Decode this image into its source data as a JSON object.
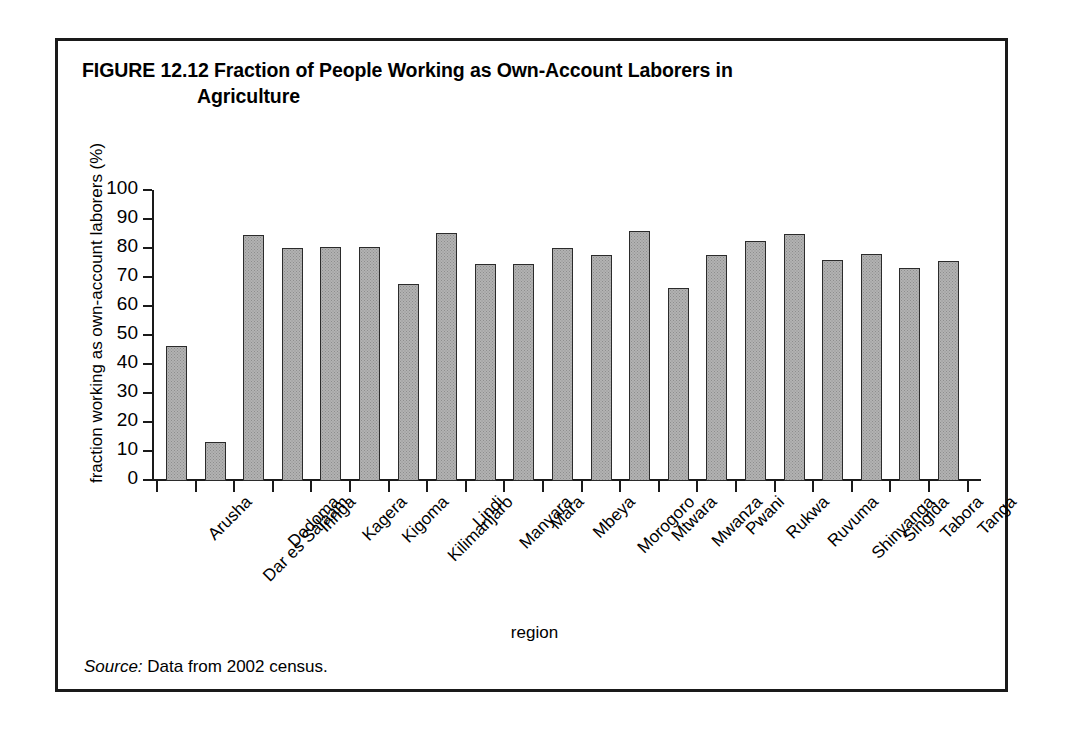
{
  "figure": {
    "label": "FIGURE 12.12",
    "title_line1": "Fraction of People Working as Own-Account Laborers in",
    "title_line2": "Agriculture",
    "source_word": "Source:",
    "source_text": " Data from 2002 census."
  },
  "chart_data": {
    "type": "bar",
    "title": "Fraction of People Working as Own-Account Laborers in Agriculture",
    "xlabel": "region",
    "ylabel": "fraction working as own-account laborers (%)",
    "ylim": [
      0,
      100
    ],
    "yticks": [
      0,
      10,
      20,
      30,
      40,
      50,
      60,
      70,
      80,
      90,
      100
    ],
    "ytick_labels": [
      "0",
      "10",
      "20",
      "30",
      "40",
      "50",
      "60",
      "70",
      "80",
      "90",
      "100"
    ],
    "grid": false,
    "legend": null,
    "bar_fill_color": "#b2b2b2",
    "bar_edge_color": "#2b2b2b",
    "categories": [
      "Arusha",
      "Dar es Salaam",
      "Dodoma",
      "Iringa",
      "Kagera",
      "Kigoma",
      "Kilimanjaro",
      "Lindi",
      "Manyara",
      "Mara",
      "Mbeya",
      "Morogoro",
      "Mtwara",
      "Mwanza",
      "Pwani",
      "Rukwa",
      "Ruvuma",
      "Shinyanga",
      "Singida",
      "Tabora",
      "Tanga"
    ],
    "values": [
      46.4,
      13.4,
      84.8,
      80.2,
      80.6,
      80.8,
      68.0,
      85.5,
      74.8,
      75.0,
      80.4,
      78.0,
      86.2,
      66.7,
      78.0,
      82.6,
      85.3,
      76.1,
      78.4,
      73.3,
      75.8
    ]
  }
}
